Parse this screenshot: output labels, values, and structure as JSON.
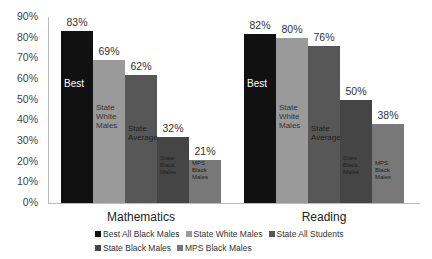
{
  "chart_data": {
    "type": "bar",
    "title": "",
    "xlabel": "",
    "ylabel": "",
    "ylim": [
      0,
      90
    ],
    "yticks": [
      "0%",
      "10%",
      "20%",
      "30%",
      "40%",
      "50%",
      "60%",
      "70%",
      "80%",
      "90%"
    ],
    "categories": [
      "Mathematics",
      "Reading"
    ],
    "series": [
      {
        "name": "Best All Black Males",
        "inner_label": "Best",
        "color": "#111111",
        "values": [
          83,
          82
        ]
      },
      {
        "name": "State White Males",
        "inner_label": "State White Males",
        "color": "#9a9a9a",
        "values": [
          69,
          80
        ]
      },
      {
        "name": "State All Students",
        "inner_label": "State Average",
        "color": "#575757",
        "values": [
          62,
          76
        ]
      },
      {
        "name": "State Black Males",
        "inner_label": "State Black Males",
        "color": "#454545",
        "values": [
          32,
          50
        ]
      },
      {
        "name": "MPS Black Males",
        "inner_label": "MPS Black Males",
        "color": "#787878",
        "values": [
          21,
          38
        ]
      }
    ],
    "data_labels": [
      [
        "83%",
        "69%",
        "62%",
        "32%",
        "21%"
      ],
      [
        "82%",
        "80%",
        "76%",
        "50%",
        "38%"
      ]
    ],
    "grid": false,
    "legend_position": "bottom"
  },
  "legend": [
    {
      "label": "Best All Black Males",
      "color": "#111111"
    },
    {
      "label": "State White Males",
      "color": "#9a9a9a"
    },
    {
      "label": "State All Students",
      "color": "#575757"
    },
    {
      "label": "State Black Males",
      "color": "#454545"
    },
    {
      "label": "MPS Black Males",
      "color": "#787878"
    }
  ]
}
